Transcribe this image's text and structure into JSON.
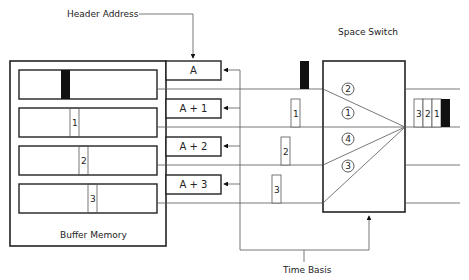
{
  "labels": {
    "header_address": "Header Address",
    "space_switch": "Space Switch",
    "buffer_memory": "Buffer Memory",
    "time_basis": "Time Basis"
  },
  "address_boxes": [
    "A",
    "A + 1",
    "A + 2",
    "A + 3"
  ],
  "buffer_rows": [
    {
      "cell": "",
      "type": "header-black"
    },
    {
      "cell": "1",
      "type": "packet"
    },
    {
      "cell": "2",
      "type": "packet"
    },
    {
      "cell": "3",
      "type": "packet"
    }
  ],
  "in_transit": [
    {
      "cell": "",
      "type": "header-black"
    },
    {
      "cell": "1",
      "type": "packet"
    },
    {
      "cell": "2",
      "type": "packet"
    },
    {
      "cell": "3",
      "type": "packet"
    }
  ],
  "switch_order": [
    "2",
    "1",
    "4",
    "3"
  ],
  "output_cells": [
    "3",
    "2",
    "1"
  ],
  "colors": {
    "line": "#222222",
    "thin": "#555555",
    "fill": "#111111"
  }
}
